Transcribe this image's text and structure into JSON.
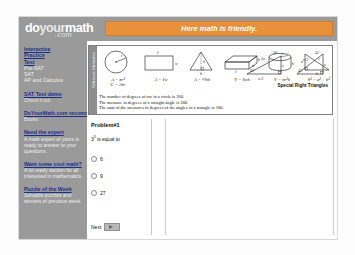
{
  "header": {
    "logo_do": "do",
    "logo_your": "your",
    "logo_math": "math",
    "logo_com": ".com",
    "banner_text": "Here math is friendly."
  },
  "sidebar": {
    "groups": [
      {
        "links": [
          "Interactive",
          "Practice",
          "Test"
        ],
        "plain": [
          "Pre-SAT",
          "SAT",
          "AP and Calculus"
        ]
      },
      {
        "links": [
          "SAT Test demo"
        ],
        "sub": [
          "Check it out"
        ]
      },
      {
        "links": [
          "DoYourMath.com recommends"
        ],
        "sub": [
          "Books"
        ]
      },
      {
        "links": [
          "Need the expert"
        ],
        "desc": "A math expert of yours is ready to answer to your questions."
      },
      {
        "links": [
          "Want some cool math?"
        ],
        "desc": "A lot ready section for all interested in mathematics."
      },
      {
        "links": [
          "Puzzle of the Week"
        ],
        "desc": "Solvable puzzles and winners of previous week."
      }
    ]
  },
  "reference": {
    "tab_label": "Reference Information",
    "figures": [
      {
        "name": "circle",
        "formula": "A = πr²",
        "formula2": "C = 2πr",
        "radius_label": "r"
      },
      {
        "name": "rectangle",
        "formula": "A = ℓw",
        "top_label": "ℓ",
        "side_label": "w"
      },
      {
        "name": "triangle",
        "formula": "A = ½bh",
        "height_label": "h",
        "base_label": "b"
      },
      {
        "name": "box",
        "formula": "V = ℓwh",
        "labels": [
          "h",
          "w",
          "ℓ"
        ]
      },
      {
        "name": "cylinder",
        "formula": "V = πr²h",
        "labels": [
          "r",
          "h"
        ]
      },
      {
        "name": "right-triangle",
        "formula": "c² = a² + b²",
        "labels": [
          "a",
          "c",
          "b"
        ]
      }
    ],
    "special_right_triangles_label": "Special Right Triangles",
    "srt_306090": {
      "angles": [
        "30°",
        "60°"
      ],
      "sides": [
        "2x",
        "x",
        "x√3"
      ]
    },
    "srt_454590": {
      "angles": [
        "45°",
        "45°"
      ],
      "sides": [
        "x",
        "x",
        "x√2"
      ]
    },
    "notes": [
      "The number of degrees of arc in a circle is 360.",
      "The measure in degrees of a straight angle is 180.",
      "The sum of the measures in degrees of the angles of a triangle is 180."
    ]
  },
  "quiz": {
    "title": "Problem#1",
    "question_base": "3",
    "question_exp": "3",
    "question_tail": " is equal to",
    "options": [
      "6",
      "9",
      "27"
    ],
    "next_label": "Next"
  },
  "colors": {
    "header_gray": "#9a9a9a",
    "banner_orange": "#e8913a",
    "link_blue": "#1a2f8a",
    "page_white": "#ffffff"
  }
}
